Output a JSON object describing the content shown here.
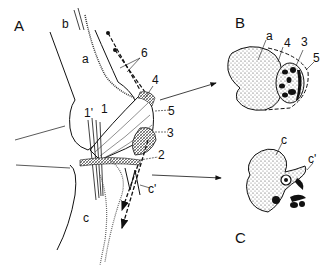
{
  "figure": {
    "panels": [
      {
        "id": "A",
        "label": "A",
        "description": "Longitudinal view of knee/elbow joint region"
      },
      {
        "id": "B",
        "label": "B",
        "description": "Cross-section through upper bone level"
      },
      {
        "id": "C",
        "label": "C",
        "description": "Cross-section through lower bone level"
      }
    ],
    "labels_A": {
      "panel": "A",
      "a": "a",
      "b": "b",
      "c": "c",
      "c_prime": "c'",
      "n1": "1",
      "n1_prime": "1'",
      "n2": "2",
      "n3": "3",
      "n4": "4",
      "n5": "5",
      "n6": "6"
    },
    "labels_B": {
      "panel": "B",
      "a": "a",
      "n3": "3",
      "n4": "4",
      "n5": "5"
    },
    "labels_C": {
      "panel": "C",
      "c": "c",
      "c_prime": "c'"
    },
    "colors": {
      "ink": "#111111",
      "stipple_fill": "#bdbdbd",
      "background": "#ffffff"
    }
  }
}
